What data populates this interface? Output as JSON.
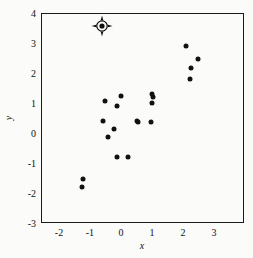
{
  "chart_data": {
    "type": "scatter",
    "title": "",
    "xlabel": "x",
    "ylabel": "y",
    "xlim": [
      -2.58,
      3.97
    ],
    "ylim": [
      -3.0,
      4.0
    ],
    "grid": false,
    "legend": null,
    "xticks": [
      -2,
      -1,
      0,
      1,
      2,
      3
    ],
    "yticks": [
      -3,
      -2,
      -1,
      0,
      1,
      2,
      3,
      4
    ],
    "xticklabels": [
      "-2",
      "-1",
      "0",
      "1",
      "2",
      "3"
    ],
    "yticklabels": [
      "-3",
      "-2",
      "-1",
      "0",
      "1",
      "2",
      "3",
      "4"
    ],
    "minor_tick_interval": 0.2,
    "marker": "filled-circle",
    "marker_color": "#111111",
    "series": [
      {
        "name": "data",
        "points": [
          {
            "x": -0.65,
            "y": 3.6,
            "highlighted": true
          },
          {
            "x": 2.07,
            "y": 2.92,
            "highlighted": false
          },
          {
            "x": 2.46,
            "y": 2.51,
            "highlighted": false
          },
          {
            "x": 2.23,
            "y": 2.21,
            "highlighted": false
          },
          {
            "x": 2.2,
            "y": 1.85,
            "highlighted": false
          },
          {
            "x": 0.96,
            "y": 1.33,
            "highlighted": false
          },
          {
            "x": 0.99,
            "y": 1.25,
            "highlighted": false
          },
          {
            "x": -0.04,
            "y": 1.27,
            "highlighted": false
          },
          {
            "x": -0.55,
            "y": 1.11,
            "highlighted": false
          },
          {
            "x": 0.98,
            "y": 1.03,
            "highlighted": false
          },
          {
            "x": -0.17,
            "y": 0.92,
            "highlighted": false
          },
          {
            "x": -0.62,
            "y": 0.44,
            "highlighted": false
          },
          {
            "x": 0.49,
            "y": 0.43,
            "highlighted": false
          },
          {
            "x": 0.53,
            "y": 0.41,
            "highlighted": false
          },
          {
            "x": 0.94,
            "y": 0.39,
            "highlighted": false
          },
          {
            "x": -0.27,
            "y": 0.16,
            "highlighted": false
          },
          {
            "x": -0.44,
            "y": -0.1,
            "highlighted": false
          },
          {
            "x": -0.15,
            "y": -0.75,
            "highlighted": false
          },
          {
            "x": 0.19,
            "y": -0.76,
            "highlighted": false
          },
          {
            "x": -1.27,
            "y": -1.5,
            "highlighted": false
          },
          {
            "x": -1.28,
            "y": -1.76,
            "highlighted": false
          }
        ]
      }
    ],
    "highlight_marker": {
      "style": "circle-with-crosshair-spikes",
      "color": "#111111",
      "x": -0.65,
      "y": 3.6
    }
  }
}
